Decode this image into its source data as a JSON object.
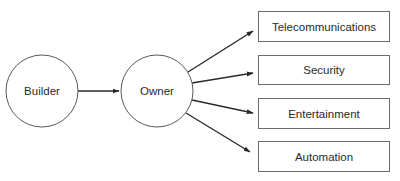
{
  "diagram": {
    "type": "flow",
    "nodes": [
      {
        "id": "builder",
        "shape": "circle",
        "label": "Builder"
      },
      {
        "id": "owner",
        "shape": "circle",
        "label": "Owner"
      },
      {
        "id": "telecommunications",
        "shape": "box",
        "label": "Telecommunications"
      },
      {
        "id": "security",
        "shape": "box",
        "label": "Security"
      },
      {
        "id": "entertainment",
        "shape": "box",
        "label": "Entertainment"
      },
      {
        "id": "automation",
        "shape": "box",
        "label": "Automation"
      }
    ],
    "edges": [
      {
        "from": "builder",
        "to": "owner"
      },
      {
        "from": "owner",
        "to": "telecommunications"
      },
      {
        "from": "owner",
        "to": "security"
      },
      {
        "from": "owner",
        "to": "entertainment"
      },
      {
        "from": "owner",
        "to": "automation"
      }
    ],
    "colors": {
      "stroke": "#2a2a2a",
      "text": "#2a2a2a",
      "background": "#ffffff"
    }
  }
}
